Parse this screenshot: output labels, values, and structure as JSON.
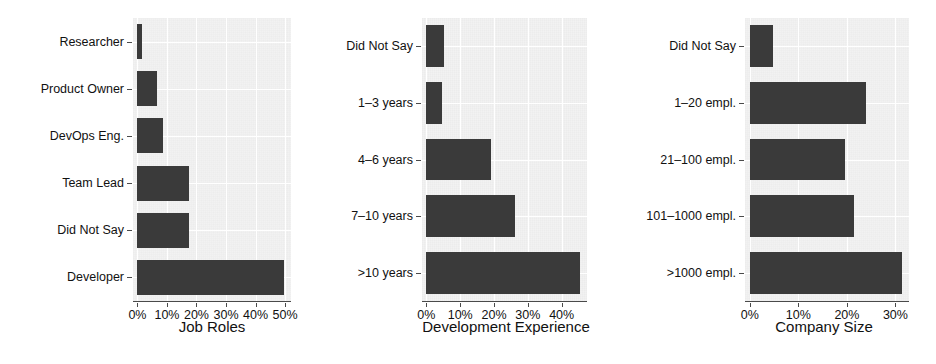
{
  "figure": {
    "background": "#ffffff",
    "panel_background": "#f2f2f2",
    "bar_color": "#3a3a3a",
    "grid_color": "#ffffff",
    "axis_color": "#4a4a4a"
  },
  "chart_data": [
    {
      "type": "bar",
      "orientation": "horizontal",
      "title": "",
      "xlabel": "Job Roles",
      "ylabel": "",
      "categories": [
        "Researcher",
        "Product Owner",
        "DevOps Eng.",
        "Team Lead",
        "Did Not Say",
        "Developer"
      ],
      "values": [
        1.5,
        6.5,
        8.7,
        17.5,
        17.3,
        49.5
      ],
      "xlim": [
        -1.5,
        52
      ],
      "xticks": [
        0,
        10,
        20,
        30,
        40,
        50
      ],
      "xticklabels": [
        "0%",
        "10%",
        "20%",
        "30%",
        "40%",
        "50%"
      ],
      "grid": true,
      "legend": "none"
    },
    {
      "type": "bar",
      "orientation": "horizontal",
      "title": "",
      "xlabel": "Development Experience",
      "ylabel": "",
      "categories": [
        "Did Not Say",
        "1–3 years",
        "4–6 years",
        "7–10 years",
        ">10 years"
      ],
      "values": [
        5.2,
        4.6,
        19.2,
        26.2,
        45.5
      ],
      "xlim": [
        -1.3,
        47.5
      ],
      "xticks": [
        0,
        10,
        20,
        30,
        40
      ],
      "xticklabels": [
        "0%",
        "10%",
        "20%",
        "30%",
        "40%"
      ],
      "grid": true,
      "legend": "none"
    },
    {
      "type": "bar",
      "orientation": "horizontal",
      "title": "",
      "xlabel": "Company Size",
      "ylabel": "",
      "categories": [
        "Did Not Say",
        "1–20 empl.",
        "21–100 empl.",
        "101–1000 empl.",
        ">1000 empl."
      ],
      "values": [
        4.7,
        23.9,
        19.6,
        21.5,
        31.3
      ],
      "xlim": [
        -1.0,
        32.8
      ],
      "xticks": [
        0,
        10,
        20,
        30
      ],
      "xticklabels": [
        "0%",
        "10%",
        "20%",
        "30%"
      ],
      "grid": true,
      "legend": "none"
    }
  ]
}
